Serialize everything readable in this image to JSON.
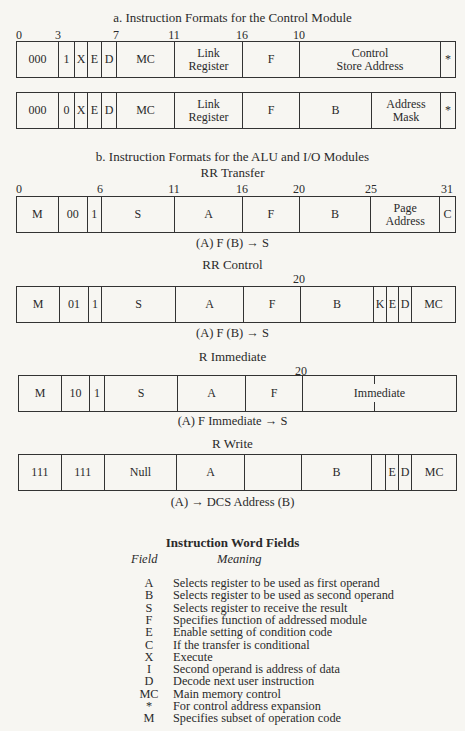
{
  "section_a": {
    "title": "a.  Instruction Formats for the Control Module",
    "ticks": [
      "0",
      "3",
      "7",
      "11",
      "16",
      "10"
    ],
    "format1": [
      "000",
      "1",
      "X",
      "E",
      "D",
      "MC",
      "Link\nRegister",
      "F",
      "Control\nStore Address",
      "*"
    ],
    "format2": [
      "000",
      "0",
      "X",
      "E",
      "D",
      "MC",
      "Link\nRegister",
      "F",
      "B",
      "Address\nMask",
      "*"
    ]
  },
  "section_b": {
    "title": "b.  Instruction Formats for the ALU and I/O Modules",
    "rr_transfer": {
      "title": "RR Transfer",
      "ticks": [
        "0",
        "6",
        "11",
        "16",
        "20",
        "25",
        "31"
      ],
      "cells": [
        "M",
        "00",
        "1",
        "S",
        "A",
        "F",
        "B",
        "Page\nAddress",
        "C"
      ],
      "caption": "(A) F (B) → S"
    },
    "rr_control": {
      "title": "RR Control",
      "ticks": [
        "20"
      ],
      "cells": [
        "M",
        "01",
        "1",
        "S",
        "A",
        "F",
        "B",
        "K",
        "E",
        "D",
        "MC"
      ],
      "caption": "(A) F (B) → S"
    },
    "r_immediate": {
      "title": "R Immediate",
      "ticks": [
        "20"
      ],
      "cells": [
        "M",
        "10",
        "1",
        "S",
        "A",
        "F",
        "Immediate"
      ],
      "caption": "(A) F Immediate → S"
    },
    "r_write": {
      "title": "R Write",
      "cells": [
        "111",
        "111",
        "Null",
        "A",
        "",
        "B",
        "",
        "E",
        "D",
        "MC"
      ],
      "caption": "(A) → DCS Address (B)"
    }
  },
  "legend": {
    "title": "Instruction Word Fields",
    "col_field": "Field",
    "col_meaning": "Meaning",
    "rows": [
      {
        "field": "A",
        "meaning": "Selects register to be used as first operand"
      },
      {
        "field": "B",
        "meaning": "Selects register to be used as second operand"
      },
      {
        "field": "S",
        "meaning": "Selects register to receive the result"
      },
      {
        "field": "F",
        "meaning": "Specifies function of addressed module"
      },
      {
        "field": "E",
        "meaning": "Enable setting of condition code"
      },
      {
        "field": "C",
        "meaning": "If the transfer is conditional"
      },
      {
        "field": "X",
        "meaning": "Execute"
      },
      {
        "field": "I",
        "meaning": "Second operand is address of data"
      },
      {
        "field": "D",
        "meaning": "Decode next user instruction"
      },
      {
        "field": "MC",
        "meaning": "Main memory control"
      },
      {
        "field": "*",
        "meaning": "For control address expansion"
      },
      {
        "field": "M",
        "meaning": "Specifies subset of operation code"
      }
    ]
  }
}
